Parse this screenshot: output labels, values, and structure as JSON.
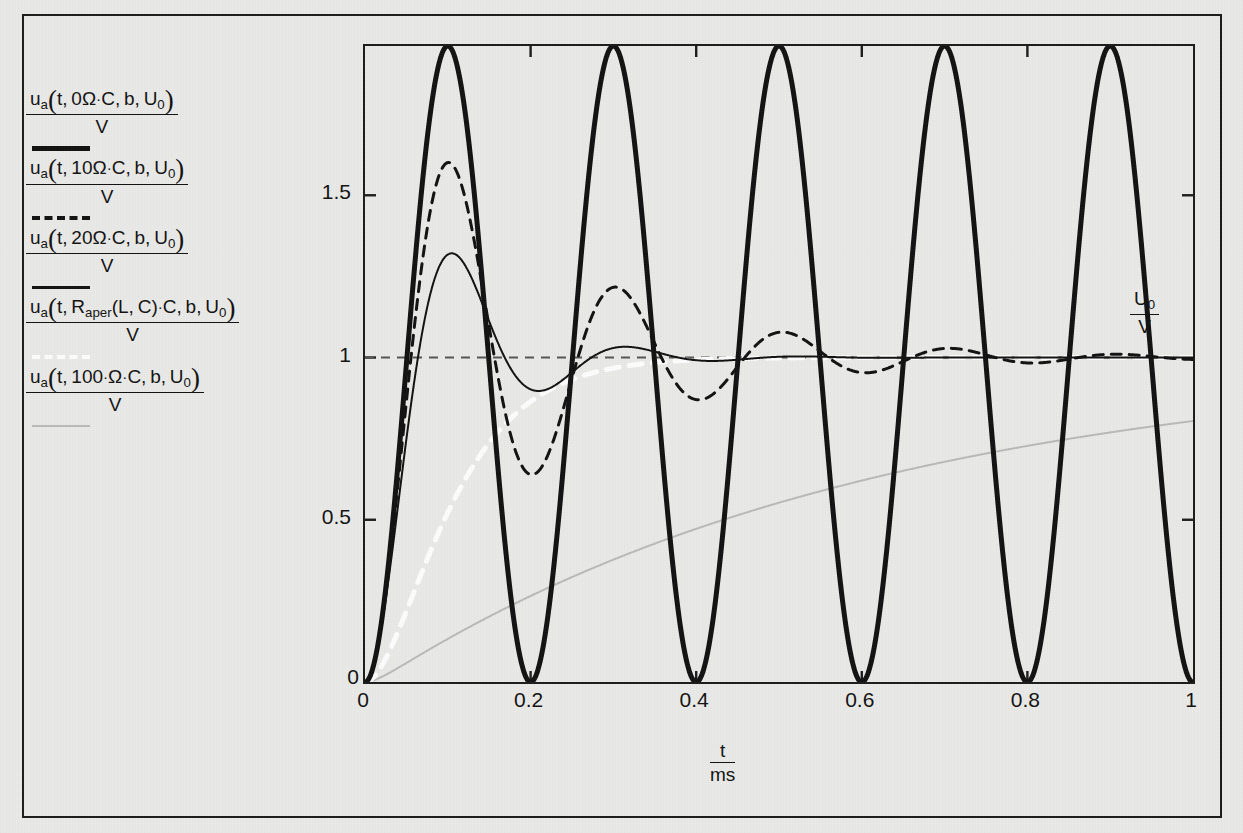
{
  "figure": {
    "background_color": "#e9e9e7",
    "frame_color": "#1b1b1b"
  },
  "legend": {
    "entries": [
      {
        "id": "legend-entry-0-ohm",
        "sample_style": "solid-thick-black",
        "sample_color": "#111111",
        "numerator_prefix": "u",
        "numerator_sub": "a",
        "numerator_args": "t, 0Ω·C, b, U",
        "numerator_args_sub": "0",
        "denominator": "V",
        "resistance": "0 Ω",
        "plain": "u_a(t, 0Ω·C, b, U₀) / V"
      },
      {
        "id": "legend-entry-10-ohm",
        "sample_style": "solid-thin-black",
        "sample_color": "#111111",
        "numerator_prefix": "u",
        "numerator_sub": "a",
        "numerator_args": "t, 10Ω·C, b, U",
        "numerator_args_sub": "0",
        "denominator": "V",
        "resistance": "10 Ω",
        "plain": "u_a(t, 10Ω·C, b, U₀) / V"
      },
      {
        "id": "legend-entry-20-ohm",
        "sample_style": "dashed-black",
        "sample_color": "#111111",
        "numerator_prefix": "u",
        "numerator_sub": "a",
        "numerator_args": "t, 20Ω·C, b, U",
        "numerator_args_sub": "0",
        "denominator": "V",
        "resistance": "20 Ω",
        "plain": "u_a(t, 20Ω·C, b, U₀) / V"
      },
      {
        "id": "legend-entry-raper",
        "sample_style": "dashed-white",
        "sample_color": "#fdfdfd",
        "numerator_prefix": "u",
        "numerator_sub": "a",
        "numerator_args": "t, R",
        "numerator_args_sub": "aper",
        "numerator_args_tail": "(L, C)·C, b, U",
        "numerator_args_tail_sub": "0",
        "denominator": "V",
        "resistance": "R_aper(L, C)",
        "plain": "u_a(t, R_aper(L,C)·C, b, U₀) / V"
      },
      {
        "id": "legend-entry-100-ohm",
        "sample_style": "solid-gray",
        "sample_color": "#b9b9b9",
        "numerator_prefix": "u",
        "numerator_sub": "a",
        "numerator_args": "t, 100·Ω·C, b, U",
        "numerator_args_sub": "0",
        "denominator": "V",
        "resistance": "100 Ω",
        "plain": "u_a(t, 100·Ω·C, b, U₀) / V"
      }
    ]
  },
  "axes": {
    "x_title_num": "t",
    "x_title_den": "ms",
    "x_ticks": [
      "0",
      "0.2",
      "0.4",
      "0.6",
      "0.8",
      "1"
    ],
    "x_tick_values": [
      0,
      0.2,
      0.4,
      0.6,
      0.8,
      1
    ],
    "y_ticks": [
      "0",
      "0.5",
      "1",
      "1.5"
    ],
    "y_tick_values": [
      0,
      0.5,
      1,
      1.5
    ],
    "xlim": [
      0,
      1
    ],
    "ylim": [
      0,
      1.96
    ],
    "reference_line_label_num": "U",
    "reference_line_label_num_sub": "0",
    "reference_line_label_den": "V",
    "reference_line_value": 1
  },
  "chart_data": {
    "type": "line",
    "title": "",
    "xlabel": "t / ms",
    "ylabel": "u_a / V",
    "xlim": [
      0,
      1
    ],
    "ylim": [
      0,
      1.96
    ],
    "grid": false,
    "legend_position": "left-outside",
    "x_ticks": [
      0,
      0.2,
      0.4,
      0.6,
      0.8,
      1
    ],
    "y_ticks": [
      0,
      0.5,
      1,
      1.5
    ],
    "annotations": [
      {
        "text": "U0/V",
        "x": 1.0,
        "y": 1.0,
        "note": "reference level dashed at y=1"
      }
    ],
    "series": [
      {
        "name": "u_a(t, 0Ω·C, b, U₀)/V",
        "label": "R = 0 Ω (undamped)",
        "style": "solid",
        "color": "#111111",
        "width": 5,
        "description": "Undamped sinusoidal oscillation 1 - cos(2*pi*t/0.2), period 0.2 ms, peaks at 2, troughs at 0",
        "formula": "1 - cos(2*pi*t/0.2)",
        "period_ms": 0.2,
        "peak_value": 1.96,
        "trough_value": 0.0,
        "x": [
          0,
          0.05,
          0.1,
          0.15,
          0.2,
          0.25,
          0.3,
          0.35,
          0.4,
          0.45,
          0.5,
          0.55,
          0.6,
          0.65,
          0.7,
          0.75,
          0.8,
          0.85,
          0.9,
          0.95,
          1.0
        ],
        "y": [
          0,
          0.98,
          1.96,
          0.98,
          0,
          0.98,
          1.96,
          0.98,
          0,
          0.98,
          1.96,
          0.98,
          0,
          0.98,
          1.96,
          0.98,
          0,
          0.98,
          1.96,
          0.98,
          0
        ]
      },
      {
        "name": "u_a(t, 10Ω·C, b, U₀)/V",
        "label": "R = 10 Ω (lightly damped)",
        "style": "solid",
        "color": "#111111",
        "width": 2,
        "description": "Damped step response, first overshoot ~1.37 at t=0.095, undershoot ~0.88 at t=0.2, settles to 1",
        "damping_ratio": 0.34,
        "x": [
          0,
          0.02,
          0.05,
          0.095,
          0.14,
          0.2,
          0.26,
          0.3,
          0.4,
          0.5,
          0.6,
          0.7,
          0.8,
          0.9,
          1.0
        ],
        "y": [
          0,
          0.22,
          0.85,
          1.37,
          1.16,
          0.88,
          0.96,
          1.04,
          1.05,
          0.99,
          1.0,
          1.0,
          1.0,
          1.0,
          1.0
        ]
      },
      {
        "name": "u_a(t, 20Ω·C, b, U₀)/V",
        "label": "R = 20 Ω (moderately oscillatory)",
        "style": "dashed",
        "color": "#111111",
        "width": 3,
        "description": "Oscillatory step response, overshoot ~1.60 at t=0.093, undershoot ~0.63 at t=0.20, second peak ~1.22 at t=0.30, decaying to 1",
        "damping_ratio": 0.16,
        "x": [
          0,
          0.02,
          0.05,
          0.093,
          0.14,
          0.2,
          0.25,
          0.3,
          0.35,
          0.4,
          0.45,
          0.5,
          0.55,
          0.6,
          0.7,
          0.8,
          0.9,
          1.0
        ],
        "y": [
          0,
          0.25,
          0.95,
          1.6,
          1.25,
          0.63,
          0.83,
          1.22,
          1.15,
          0.88,
          0.93,
          1.08,
          1.06,
          0.95,
          1.04,
          0.98,
          1.02,
          0.99
        ]
      },
      {
        "name": "u_a(t, R_aper(L,C)·C, b, U₀)/V",
        "label": "R = R_aper (critically damped, aperiodic limit)",
        "style": "dashed",
        "color": "#fdfdfd",
        "width": 5,
        "description": "Critically damped step response, no overshoot, reaches ~1 by t=0.33",
        "damping_ratio": 1.0,
        "x": [
          0,
          0.03,
          0.06,
          0.09,
          0.12,
          0.16,
          0.2,
          0.25,
          0.3,
          0.4,
          0.6,
          0.8,
          1.0
        ],
        "y": [
          0,
          0.3,
          0.56,
          0.73,
          0.84,
          0.92,
          0.96,
          0.985,
          0.995,
          1.0,
          1.0,
          1.0,
          1.0
        ]
      },
      {
        "name": "u_a(t, 100·Ω·C, b, U₀)/V",
        "label": "R = 100 Ω (overdamped)",
        "style": "solid",
        "color": "#b9b9b9",
        "width": 2,
        "description": "Overdamped slow exponential rise, reaches ~1 near t=0.5",
        "damping_ratio": 3.4,
        "x": [
          0,
          0.05,
          0.1,
          0.15,
          0.2,
          0.25,
          0.3,
          0.35,
          0.4,
          0.5,
          0.6,
          0.8,
          1.0
        ],
        "y": [
          0,
          0.2,
          0.38,
          0.54,
          0.67,
          0.77,
          0.85,
          0.9,
          0.94,
          0.985,
          1.0,
          1.0,
          1.0
        ]
      }
    ]
  }
}
